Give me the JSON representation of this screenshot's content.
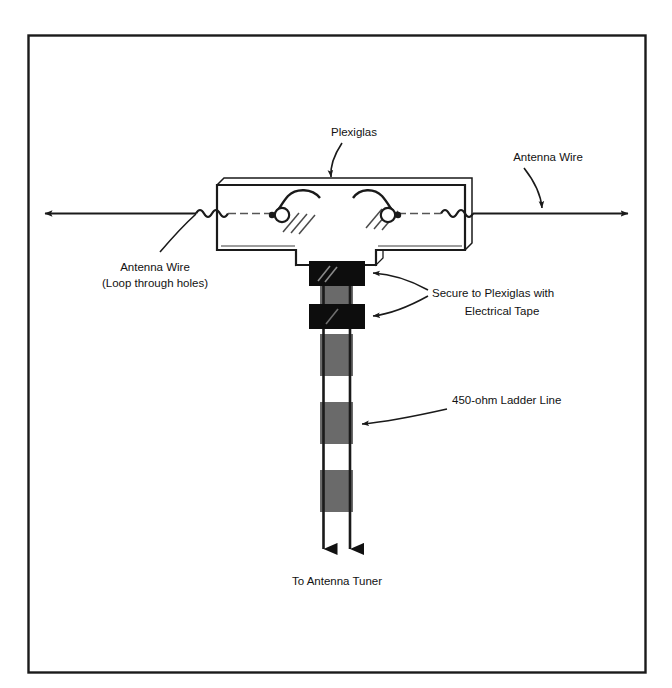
{
  "figure": {
    "frame": {
      "stroke_color": "#1a1a1a",
      "background_color": "#ffffff"
    },
    "colors": {
      "line": "#1a1a1a",
      "tape_black": "#0d0d0d",
      "ladder_gray": "#6a6a6a",
      "plexiglas_fill": "#ffffff",
      "hatch": "#4a4a4a"
    },
    "labels": {
      "plexiglas": "Plexiglas",
      "antenna_wire_right": "Antenna Wire",
      "antenna_wire_left_line1": "Antenna Wire",
      "antenna_wire_left_line2": "(Loop through holes)",
      "tape_line1": "Secure to Plexiglas with",
      "tape_line2": "Electrical Tape",
      "ladder_line": "450-ohm Ladder Line",
      "tuner": "To Antenna Tuner"
    },
    "components": {
      "plexiglas_shape": "T-shaped slab",
      "holes_count": 2,
      "tape_wraps_count": 2,
      "ladder_conductors": 2,
      "ladder_segments": 7,
      "feed_arrows": 2,
      "antenna_arrows": 2
    }
  }
}
